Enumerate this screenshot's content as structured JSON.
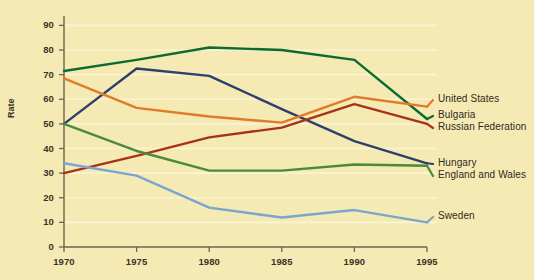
{
  "chart_data": {
    "type": "line",
    "title": "",
    "subtitle": "",
    "xlabel": "",
    "ylabel": "Rate",
    "x": [
      1970,
      1975,
      1980,
      1985,
      1990,
      1995
    ],
    "xtick_labels": [
      "1970",
      "1975",
      "1980",
      "1985",
      "1990",
      "1995"
    ],
    "xlim": [
      1968.5,
      1996.5
    ],
    "ytick_labels": [
      "0",
      "10",
      "20",
      "30",
      "40",
      "50",
      "60",
      "70",
      "80",
      "90"
    ],
    "yticks": [
      0,
      10,
      20,
      30,
      40,
      50,
      60,
      70,
      80,
      90
    ],
    "ylim": [
      0,
      93
    ],
    "grid": "horizontal-faint-white",
    "legend_position": "right-inline-at-line-end",
    "background_color": "#f6eab4",
    "axis_color": "#6e6450",
    "series": [
      {
        "name": "Bulgaria",
        "color": "#0b6b31",
        "values": [
          71.5,
          76.0,
          81.0,
          80.0,
          76.0,
          52.0
        ]
      },
      {
        "name": "Hungary",
        "color": "#2e3f6e",
        "values": [
          50.0,
          72.5,
          69.5,
          56.0,
          43.0,
          34.0
        ]
      },
      {
        "name": "United States",
        "color": "#e07b28",
        "values": [
          68.5,
          56.5,
          53.0,
          50.5,
          61.0,
          57.0
        ]
      },
      {
        "name": "Russian Federation",
        "color": "#a83218",
        "values": [
          30.0,
          37.0,
          44.5,
          48.5,
          58.0,
          50.0
        ]
      },
      {
        "name": "England and Wales",
        "color": "#4a8a3a",
        "values": [
          50.0,
          39.0,
          31.0,
          31.0,
          33.5,
          33.0
        ]
      },
      {
        "name": "Sweden",
        "color": "#7aa5cc",
        "values": [
          34.0,
          29.0,
          16.0,
          12.0,
          15.0,
          10.0
        ]
      }
    ],
    "legend_labels": [
      {
        "text": "United States",
        "color": "#e07b28"
      },
      {
        "text": "Bulgaria",
        "color": "#0b6b31"
      },
      {
        "text": "Russian Federation",
        "color": "#a83218"
      },
      {
        "text": "Hungary",
        "color": "#2e3f6e"
      },
      {
        "text": "England and Wales",
        "color": "#4a8a3a"
      },
      {
        "text": "Sweden",
        "color": "#7aa5cc"
      }
    ]
  }
}
